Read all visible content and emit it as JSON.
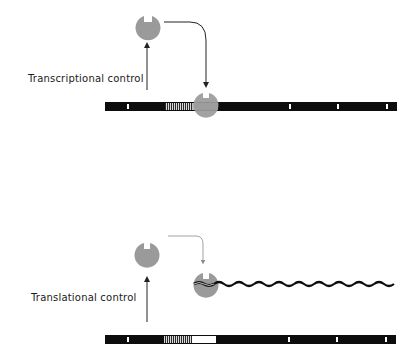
{
  "labels": {
    "transcriptional": "Transcriptional control",
    "translational": "Translational control"
  },
  "colors": {
    "dna": "#0d0d0d",
    "protein": "#9a9a9a",
    "mark": "#ffffff",
    "arrow": "#222222",
    "arrow_light": "#8a8a8a"
  },
  "panels": [
    {
      "name": "transcriptional-control",
      "label": "Transcriptional control"
    },
    {
      "name": "translational-control",
      "label": "Translational control"
    }
  ]
}
